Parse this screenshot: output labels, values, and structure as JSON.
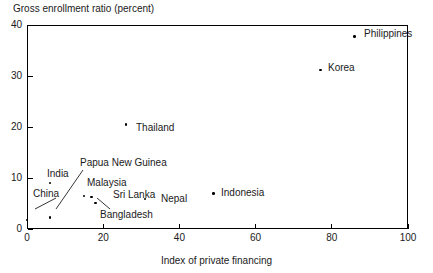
{
  "chart_data": {
    "type": "scatter",
    "title": "",
    "ylabel": "Gross enrollment ratio (percent)",
    "xlabel": "Index of private financing",
    "xlim": [
      0,
      100
    ],
    "ylim": [
      0,
      40
    ],
    "xticks": [
      "0",
      "20",
      "40",
      "60",
      "80",
      "100"
    ],
    "xtick_values": [
      0,
      20,
      40,
      60,
      80,
      100
    ],
    "yticks": [
      "0",
      "10",
      "20",
      "30",
      "40"
    ],
    "ytick_values": [
      0,
      10,
      20,
      30,
      40
    ],
    "grid": false,
    "legend": "none",
    "points": [
      {
        "name": "China",
        "x": 0,
        "y": 1.8
      },
      {
        "name": "India",
        "x": 6,
        "y": 9.0
      },
      {
        "name": "Papua New Guinea",
        "x": 6,
        "y": 2.2
      },
      {
        "name": "Malaysia",
        "x": 15,
        "y": 6.5
      },
      {
        "name": "Sri Lanka",
        "x": 17,
        "y": 6.3
      },
      {
        "name": "Bangladesh",
        "x": 18,
        "y": 5.1
      },
      {
        "name": "Thailand",
        "x": 26,
        "y": 20.5
      },
      {
        "name": "Nepal",
        "x": 31,
        "y": 5.9
      },
      {
        "name": "Indonesia",
        "x": 49,
        "y": 7.0
      },
      {
        "name": "Korea",
        "x": 77,
        "y": 31.2
      },
      {
        "name": "Philippines",
        "x": 86,
        "y": 37.8
      }
    ],
    "labels": [
      {
        "name": "China",
        "text": "China",
        "left": 33,
        "top": 188,
        "leader": [
          [
            56,
            198
          ],
          [
            35,
            209
          ]
        ]
      },
      {
        "name": "India",
        "text": "India",
        "left": 47,
        "top": 168,
        "leader": null
      },
      {
        "name": "Papua New Guinea",
        "text": "Papua New Guinea",
        "left": 80,
        "top": 157,
        "leader": [
          [
            83,
            170
          ],
          [
            56,
            209
          ]
        ]
      },
      {
        "name": "Malaysia",
        "text": "Malaysia",
        "left": 87,
        "top": 177,
        "leader": null
      },
      {
        "name": "Sri Lanka",
        "text": "Sri Lanka",
        "left": 113,
        "top": 189,
        "leader": null
      },
      {
        "name": "Bangladesh",
        "text": "Bangladesh",
        "left": 100,
        "top": 209,
        "leader": [
          [
            110,
            209
          ],
          [
            97,
            198
          ]
        ]
      },
      {
        "name": "Thailand",
        "text": "Thailand",
        "left": 136,
        "top": 122,
        "leader": null
      },
      {
        "name": "Nepal",
        "text": "Nepal",
        "left": 161,
        "top": 193,
        "leader": null
      },
      {
        "name": "Indonesia",
        "text": "Indonesia",
        "left": 221,
        "top": 187,
        "leader": null
      },
      {
        "name": "Korea",
        "text": "Korea",
        "left": 328,
        "top": 62,
        "leader": null
      },
      {
        "name": "Philippines",
        "text": "Philippines",
        "left": 364,
        "top": 28,
        "leader": null
      }
    ]
  }
}
